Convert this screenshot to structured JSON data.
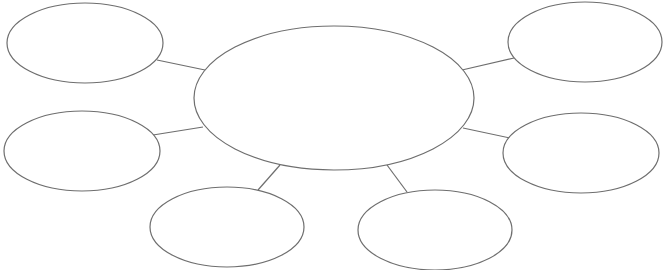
{
  "diagram": {
    "type": "bubble-map",
    "width": 663,
    "height": 270,
    "background": "#ffffff",
    "stroke_color": "#6e6e6e",
    "center": {
      "id": "center",
      "label": "",
      "cx": 334,
      "cy": 98,
      "rx": 140,
      "ry": 72
    },
    "satellites": [
      {
        "id": "top-left",
        "label": "",
        "cx": 85,
        "cy": 43,
        "rx": 78,
        "ry": 40
      },
      {
        "id": "top-right",
        "label": "",
        "cx": 585,
        "cy": 42,
        "rx": 77,
        "ry": 40
      },
      {
        "id": "middle-left",
        "label": "",
        "cx": 82,
        "cy": 151,
        "rx": 78,
        "ry": 40
      },
      {
        "id": "middle-right",
        "label": "",
        "cx": 581,
        "cy": 153,
        "rx": 78,
        "ry": 40
      },
      {
        "id": "bottom-left",
        "label": "",
        "cx": 227,
        "cy": 227,
        "rx": 77,
        "ry": 40
      },
      {
        "id": "bottom-right",
        "label": "",
        "cx": 435,
        "cy": 230,
        "rx": 77,
        "ry": 40
      }
    ],
    "connectors": [
      {
        "from": "top-left",
        "to": "center",
        "x1": 157,
        "y1": 60,
        "x2": 205,
        "y2": 70
      },
      {
        "from": "middle-left",
        "to": "center",
        "x1": 153,
        "y1": 135,
        "x2": 203,
        "y2": 127
      },
      {
        "from": "bottom-left",
        "to": "center",
        "x1": 258,
        "y1": 190,
        "x2": 280,
        "y2": 165
      },
      {
        "from": "bottom-right",
        "to": "center",
        "x1": 407,
        "y1": 192,
        "x2": 387,
        "y2": 165
      },
      {
        "from": "top-right",
        "to": "center",
        "x1": 514,
        "y1": 58,
        "x2": 462,
        "y2": 70
      },
      {
        "from": "middle-right",
        "to": "center",
        "x1": 510,
        "y1": 138,
        "x2": 463,
        "y2": 128
      }
    ]
  }
}
